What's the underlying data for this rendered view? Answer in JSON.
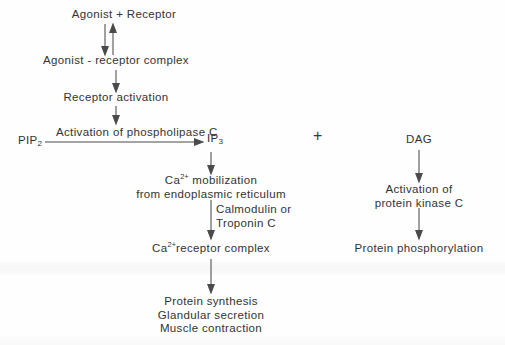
{
  "diagram": {
    "type": "flowchart",
    "background_color": "#fefefe",
    "line_color": "#4a4a4a",
    "text_color": "#333333",
    "nodes": {
      "agonist_receptor": "Agonist + Receptor",
      "agonist_receptor_complex": "Agonist - receptor complex",
      "receptor_activation": "Receptor activation",
      "pip2_base": "PIP",
      "pip2_sub": "2",
      "ip3_base": "IP",
      "ip3_sub": "3",
      "plus": "+",
      "dag": "DAG",
      "ca_mobilization_base": "Ca",
      "ca_mobilization_sup": "2+",
      "ca_mobilization_rest": " mobilization",
      "ca_mobilization_line2": "from endoplasmic reticulum",
      "ca_receptor_complex_base": "Ca",
      "ca_receptor_complex_sup": "2+",
      "ca_receptor_complex_rest": "receptor complex",
      "protein_kinase_c_line1": "Activation of",
      "protein_kinase_c_line2": "protein kinase C",
      "protein_phosphorylation": "Protein phosphorylation",
      "outcome_line1": "Protein synthesis",
      "outcome_line2": "Glandular secretion",
      "outcome_line3": "Muscle contraction"
    },
    "edge_labels": {
      "phospholipase_c": "Activation of phospholipase C",
      "calmodulin_line1": "Calmodulin or",
      "calmodulin_line2": "Troponin C"
    }
  }
}
